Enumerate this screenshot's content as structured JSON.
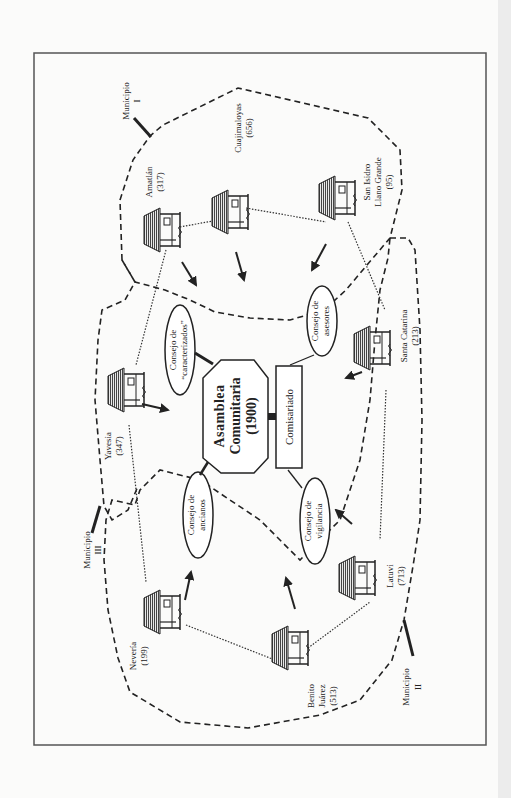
{
  "figure": {
    "orientation": "rotated 90deg counter-clockwise",
    "center": {
      "assembly": {
        "line1": "Asamblea",
        "line2": "Comunitaria",
        "line3": "(1900)"
      },
      "commissariat": "Comisariado"
    },
    "councils": [
      {
        "id": "caracterizados",
        "line1": "Consejo de",
        "line2": "“caracterizados”"
      },
      {
        "id": "ancianos",
        "line1": "Consejo de",
        "line2": "ancianos"
      },
      {
        "id": "asesores",
        "line1": "Consejo de",
        "line2": "asesores"
      },
      {
        "id": "vigilancia",
        "line1": "Consejo de",
        "line2": "vigilancia"
      }
    ],
    "communities": [
      {
        "name": "Amatlán",
        "population": "(317)"
      },
      {
        "name": "Cuajimaloyas",
        "population": "(656)"
      },
      {
        "name_line1": "San Isidro",
        "name_line2": "Llano Grande",
        "population": "(95)"
      },
      {
        "name": "Santa Catarina",
        "population": "(213)"
      },
      {
        "name": "Latuvi",
        "population": "(713)"
      },
      {
        "name_line1": "Benito",
        "name_line2": "Juárez",
        "population": "(513)"
      },
      {
        "name": "Nevería",
        "population": "(199)"
      },
      {
        "name": "Yavesia",
        "population": "(347)"
      }
    ],
    "municipalities": [
      {
        "label": "Municipio",
        "numeral": "I"
      },
      {
        "label": "Municipio",
        "numeral": "II"
      },
      {
        "label": "Municipio",
        "numeral": "III"
      }
    ],
    "colors": {
      "ink": "#222222",
      "frame": "#555555",
      "roof": "#555555",
      "paper": "#fbfbfa"
    }
  }
}
